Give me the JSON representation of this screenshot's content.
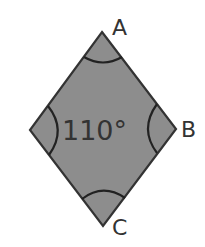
{
  "diagram": {
    "type": "rhombus",
    "colors": {
      "fill": "#8d8d8d",
      "stroke": "#333333",
      "text": "#333333",
      "background": "#ffffff"
    },
    "vertices": {
      "A": {
        "label": "A",
        "x": 102,
        "y": 32
      },
      "B": {
        "label": "B",
        "x": 176,
        "y": 129
      },
      "C": {
        "label": "C",
        "x": 103,
        "y": 226
      },
      "D": {
        "label": "",
        "x": 30,
        "y": 130
      }
    },
    "angle_annotation": {
      "text": "110°",
      "vertex": "left"
    },
    "angle_marks": [
      "A",
      "B",
      "C",
      "left"
    ]
  }
}
